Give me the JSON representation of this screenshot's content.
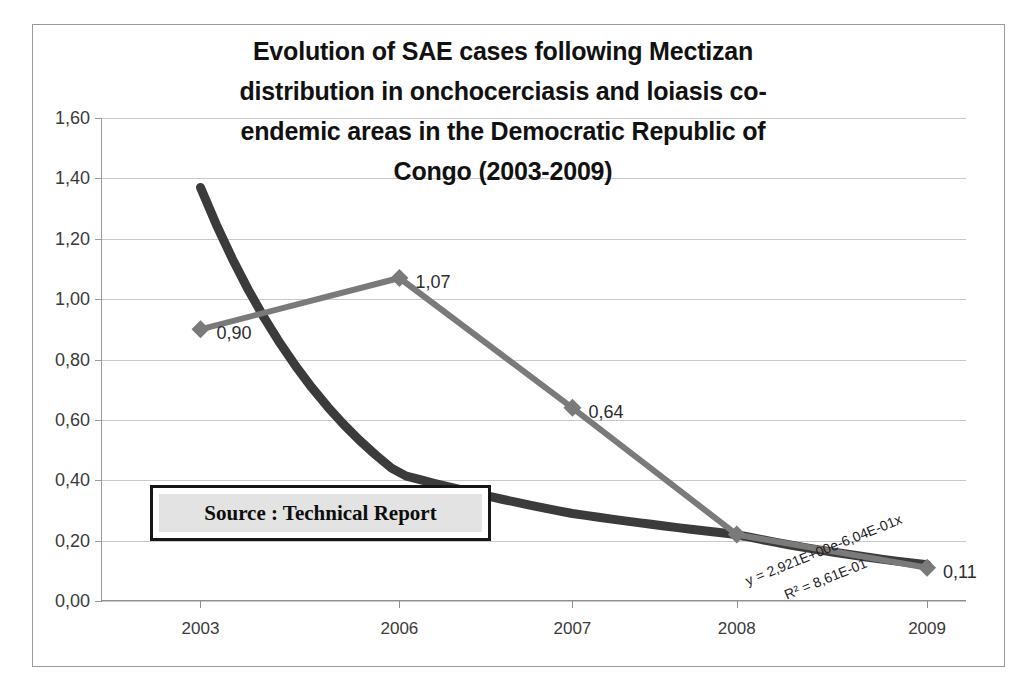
{
  "chart_data": {
    "type": "line",
    "title_lines": [
      "Evolution of SAE cases following Mectizan",
      "distribution in onchocerciasis and loiasis co-",
      "endemic areas in the Democratic Republic of",
      "Congo  (2003-2009)"
    ],
    "xlabel": "",
    "ylabel": "",
    "categories": [
      "2003",
      "2006",
      "2007",
      "2008",
      "2009"
    ],
    "series": [
      {
        "name": "SAE cases",
        "values": [
          0.9,
          1.07,
          0.64,
          0.22,
          0.11
        ],
        "labels": [
          "0,90",
          "1,07",
          "0,64",
          "",
          "0,11"
        ],
        "color": "#7a7a7a",
        "marker": "diamond"
      }
    ],
    "trendline": {
      "name": "Exponential trendline",
      "equation": "y = 2,921E+00e-6,04E-01x",
      "r_squared": "R² = 8,61E-01",
      "color": "#3b3b3b",
      "values": [
        1.37,
        0.42,
        0.29,
        0.22,
        0.12
      ]
    },
    "ylim": [
      0.0,
      1.6
    ],
    "yticks": [
      "0,00",
      "0,20",
      "0,40",
      "0,60",
      "0,80",
      "1,00",
      "1,20",
      "1,40",
      "1,60"
    ],
    "ytick_values": [
      0.0,
      0.2,
      0.4,
      0.6,
      0.8,
      1.0,
      1.2,
      1.4,
      1.6
    ],
    "grid": true,
    "legend": "none",
    "annotation": {
      "source_text": "Source : Technical Report",
      "fill_color": "#e3e3e3",
      "border_color": "#161616"
    }
  }
}
